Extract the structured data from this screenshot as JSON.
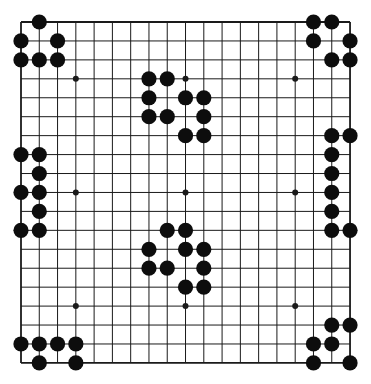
{
  "board": {
    "size": 19,
    "origin": {
      "x": 21,
      "y": 22
    },
    "spacing": {
      "x": 18.28,
      "y": 18.94
    },
    "line_color": "#1a1a1a",
    "background": "#ffffff",
    "stone_color": "#0d0d0d",
    "stone_radius": 7.6,
    "hoshi_radius": 3,
    "hoshi": [
      [
        3,
        3
      ],
      [
        9,
        3
      ],
      [
        15,
        3
      ],
      [
        3,
        9
      ],
      [
        9,
        9
      ],
      [
        15,
        9
      ],
      [
        3,
        15
      ],
      [
        9,
        15
      ],
      [
        15,
        15
      ]
    ]
  },
  "stones": {
    "color": "black",
    "groups": [
      {
        "name": "top-left-corner",
        "points": [
          [
            1,
            0
          ],
          [
            0,
            1
          ],
          [
            2,
            1
          ],
          [
            0,
            2
          ],
          [
            1,
            2
          ],
          [
            2,
            2
          ]
        ]
      },
      {
        "name": "top-right-corner",
        "points": [
          [
            16,
            0
          ],
          [
            17,
            0
          ],
          [
            16,
            1
          ],
          [
            18,
            1
          ],
          [
            17,
            2
          ],
          [
            18,
            2
          ]
        ]
      },
      {
        "name": "upper-center",
        "points": [
          [
            7,
            3
          ],
          [
            8,
            3
          ],
          [
            7,
            4
          ],
          [
            9,
            4
          ],
          [
            10,
            4
          ],
          [
            7,
            5
          ],
          [
            8,
            5
          ],
          [
            10,
            5
          ],
          [
            9,
            6
          ],
          [
            10,
            6
          ]
        ]
      },
      {
        "name": "left-side",
        "points": [
          [
            0,
            7
          ],
          [
            1,
            7
          ],
          [
            1,
            8
          ],
          [
            0,
            9
          ],
          [
            1,
            9
          ],
          [
            1,
            10
          ],
          [
            0,
            11
          ],
          [
            1,
            11
          ]
        ]
      },
      {
        "name": "right-side",
        "points": [
          [
            17,
            6
          ],
          [
            18,
            6
          ],
          [
            17,
            7
          ],
          [
            17,
            8
          ],
          [
            17,
            9
          ],
          [
            17,
            10
          ],
          [
            17,
            11
          ],
          [
            18,
            11
          ]
        ]
      },
      {
        "name": "lower-center",
        "points": [
          [
            8,
            11
          ],
          [
            9,
            11
          ],
          [
            7,
            12
          ],
          [
            9,
            12
          ],
          [
            10,
            12
          ],
          [
            7,
            13
          ],
          [
            8,
            13
          ],
          [
            10,
            13
          ],
          [
            9,
            14
          ],
          [
            10,
            14
          ]
        ]
      },
      {
        "name": "bottom-left-corner",
        "points": [
          [
            0,
            17
          ],
          [
            1,
            17
          ],
          [
            2,
            17
          ],
          [
            3,
            17
          ],
          [
            1,
            18
          ],
          [
            3,
            18
          ]
        ]
      },
      {
        "name": "bottom-right-corner",
        "points": [
          [
            17,
            16
          ],
          [
            18,
            16
          ],
          [
            16,
            17
          ],
          [
            17,
            17
          ],
          [
            16,
            18
          ],
          [
            18,
            18
          ]
        ]
      }
    ]
  }
}
